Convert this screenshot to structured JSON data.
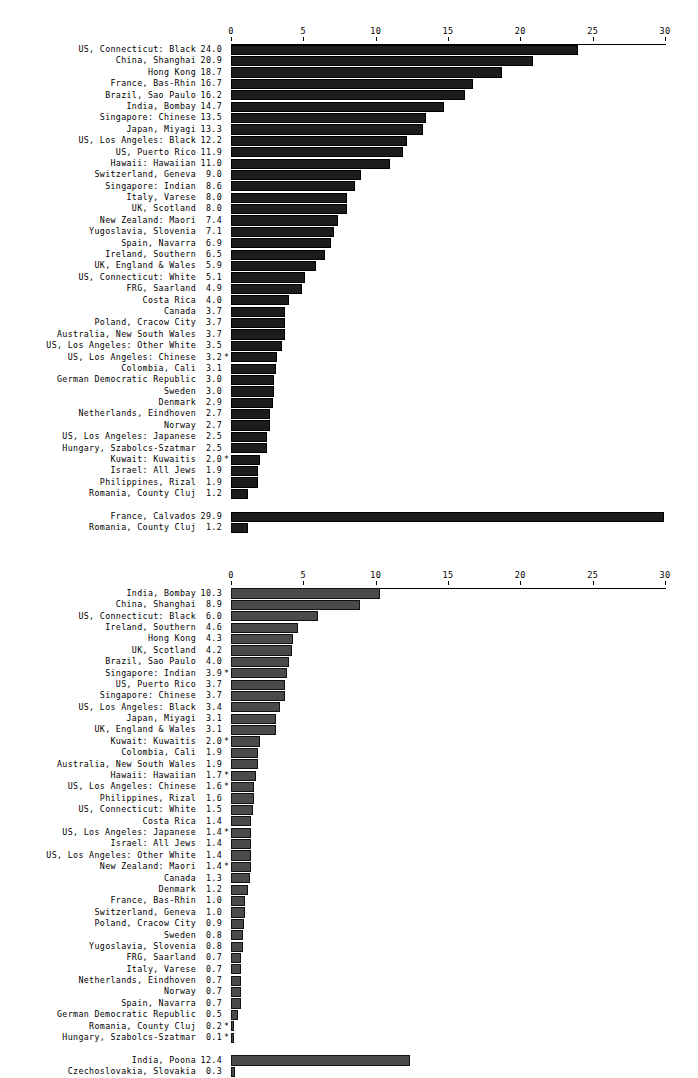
{
  "page": {
    "background": "#ffffff",
    "bar_color_top": "#1c1c1c",
    "bar_color_bottom": "#4a4a4a",
    "footnote_marker": "*"
  },
  "chart_data": [
    {
      "type": "bar",
      "orientation": "horizontal",
      "title": "",
      "xlabel": "",
      "ylabel": "",
      "xlim": [
        0,
        30
      ],
      "xticks": [
        0,
        5,
        10,
        15,
        20,
        25,
        30
      ],
      "xtick_labels": [
        "0",
        "5",
        "10",
        "15",
        "20",
        "25",
        "30"
      ],
      "grid": false,
      "legend": "none",
      "bar_color": "#1c1c1c",
      "categories": [
        "US, Connecticut: Black",
        "China, Shanghai",
        "Hong Kong",
        "France, Bas-Rhin",
        "Brazil, Sao Paulo",
        "India, Bombay",
        "Singapore: Chinese",
        "Japan, Miyagi",
        "US, Los Angeles: Black",
        "US, Puerto Rico",
        "Hawaii: Hawaiian",
        "Switzerland, Geneva",
        "Singapore: Indian",
        "Italy, Varese",
        "UK, Scotland",
        "New Zealand: Maori",
        "Yugoslavia, Slovenia",
        "Spain, Navarra",
        "Ireland, Southern",
        "UK, England & Wales",
        "US, Connecticut: White",
        "FRG, Saarland",
        "Costa Rica",
        "Canada",
        "Poland, Cracow City",
        "Australia, New South Wales",
        "US, Los Angeles: Other White",
        "US, Los Angeles: Chinese",
        "Colombia, Cali",
        "German Democratic Republic",
        "Sweden",
        "Denmark",
        "Netherlands, Eindhoven",
        "Norway",
        "US, Los Angeles: Japanese",
        "Hungary, Szabolcs-Szatmar",
        "Kuwait: Kuwaitis",
        "Israel: All Jews",
        "Philippines, Rizal",
        "Romania, County Cluj"
      ],
      "values": [
        24.0,
        20.9,
        18.7,
        16.7,
        16.2,
        14.7,
        13.5,
        13.3,
        12.2,
        11.9,
        11.0,
        9.0,
        8.6,
        8.0,
        8.0,
        7.4,
        7.1,
        6.9,
        6.5,
        5.9,
        5.1,
        4.9,
        4.0,
        3.7,
        3.7,
        3.7,
        3.5,
        3.2,
        3.1,
        3.0,
        3.0,
        2.9,
        2.7,
        2.7,
        2.5,
        2.5,
        2.0,
        1.9,
        1.9,
        1.2
      ],
      "value_labels": [
        "24.0",
        "20.9",
        "18.7",
        "16.7",
        "16.2",
        "14.7",
        "13.5",
        "13.3",
        "12.2",
        "11.9",
        "11.0",
        "9.0",
        "8.6",
        "8.0",
        "8.0",
        "7.4",
        "7.1",
        "6.9",
        "6.5",
        "5.9",
        "5.1",
        "4.9",
        "4.0",
        "3.7",
        "3.7",
        "3.7",
        "3.5",
        "3.2",
        "3.1",
        "3.0",
        "3.0",
        "2.9",
        "2.7",
        "2.7",
        "2.5",
        "2.5",
        "2.0",
        "1.9",
        "1.9",
        "1.2"
      ],
      "stars": [
        "",
        "",
        "",
        "",
        "",
        "",
        "",
        "",
        "",
        "",
        "",
        "",
        "",
        "",
        "",
        "",
        "",
        "",
        "",
        "",
        "",
        "",
        "",
        "",
        "",
        "",
        "",
        "*",
        "",
        "",
        "",
        "",
        "",
        "",
        "",
        "",
        "*",
        "",
        "",
        ""
      ],
      "extra_group": {
        "categories": [
          "France, Calvados",
          "Romania, County Cluj"
        ],
        "values": [
          29.9,
          1.2
        ],
        "value_labels": [
          "29.9",
          "1.2"
        ],
        "stars": [
          "",
          ""
        ]
      }
    },
    {
      "type": "bar",
      "orientation": "horizontal",
      "title": "",
      "xlabel": "",
      "ylabel": "",
      "xlim": [
        0,
        30
      ],
      "xticks": [
        0,
        5,
        10,
        15,
        20,
        25,
        30
      ],
      "xtick_labels": [
        "0",
        "5",
        "10",
        "15",
        "20",
        "25",
        "30"
      ],
      "grid": false,
      "legend": "none",
      "bar_color": "#4a4a4a",
      "categories": [
        "India, Bombay",
        "China, Shanghai",
        "US, Connecticut: Black",
        "Ireland, Southern",
        "Hong Kong",
        "UK, Scotland",
        "Brazil, Sao Paulo",
        "Singapore: Indian",
        "US, Puerto Rico",
        "Singapore: Chinese",
        "US, Los Angeles: Black",
        "Japan, Miyagi",
        "UK, England & Wales",
        "Kuwait: Kuwaitis",
        "Colombia, Cali",
        "Australia, New South Wales",
        "Hawaii: Hawaiian",
        "US, Los Angeles: Chinese",
        "Philippines, Rizal",
        "US, Connecticut: White",
        "Costa Rica",
        "US, Los Angeles: Japanese",
        "Israel: All Jews",
        "US, Los Angeles: Other White",
        "New Zealand: Maori",
        "Canada",
        "Denmark",
        "France, Bas-Rhin",
        "Switzerland, Geneva",
        "Poland, Cracow City",
        "Sweden",
        "Yugoslavia, Slovenia",
        "FRG, Saarland",
        "Italy, Varese",
        "Netherlands, Eindhoven",
        "Norway",
        "Spain, Navarra",
        "German Democratic Republic",
        "Romania, County Cluj",
        "Hungary, Szabolcs-Szatmar"
      ],
      "values": [
        10.3,
        8.9,
        6.0,
        4.6,
        4.3,
        4.2,
        4.0,
        3.9,
        3.7,
        3.7,
        3.4,
        3.1,
        3.1,
        2.0,
        1.9,
        1.9,
        1.7,
        1.6,
        1.6,
        1.5,
        1.4,
        1.4,
        1.4,
        1.4,
        1.4,
        1.3,
        1.2,
        1.0,
        1.0,
        0.9,
        0.8,
        0.8,
        0.7,
        0.7,
        0.7,
        0.7,
        0.7,
        0.5,
        0.2,
        0.1
      ],
      "value_labels": [
        "10.3",
        "8.9",
        "6.0",
        "4.6",
        "4.3",
        "4.2",
        "4.0",
        "3.9",
        "3.7",
        "3.7",
        "3.4",
        "3.1",
        "3.1",
        "2.0",
        "1.9",
        "1.9",
        "1.7",
        "1.6",
        "1.6",
        "1.5",
        "1.4",
        "1.4",
        "1.4",
        "1.4",
        "1.4",
        "1.3",
        "1.2",
        "1.0",
        "1.0",
        "0.9",
        "0.8",
        "0.8",
        "0.7",
        "0.7",
        "0.7",
        "0.7",
        "0.7",
        "0.5",
        "0.2",
        "0.1"
      ],
      "stars": [
        "",
        "",
        "",
        "",
        "",
        "",
        "",
        "*",
        "",
        "",
        "",
        "",
        "",
        "*",
        "",
        "",
        "*",
        "*",
        "",
        "",
        "",
        "*",
        "",
        "",
        "*",
        "",
        "",
        "",
        "",
        "",
        "",
        "",
        "",
        "",
        "",
        "",
        "",
        "",
        "*",
        "*"
      ],
      "extra_group": {
        "categories": [
          "India, Poona",
          "Czechoslovakia, Slovakia"
        ],
        "values": [
          12.4,
          0.3
        ],
        "value_labels": [
          "12.4",
          "0.3"
        ],
        "stars": [
          "",
          ""
        ]
      }
    }
  ]
}
